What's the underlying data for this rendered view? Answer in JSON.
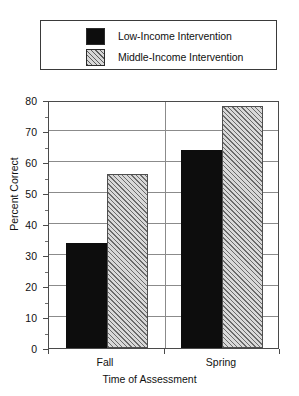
{
  "chart_data": {
    "type": "bar",
    "title": "",
    "xlabel": "Time of Assessment",
    "ylabel": "Percent Correct",
    "categories": [
      "Fall",
      "Spring"
    ],
    "series": [
      {
        "name": "Low-Income Intervention",
        "values": [
          34,
          64
        ],
        "fill": "solid",
        "color": "#0d0d0d"
      },
      {
        "name": "Middle-Income Intervention",
        "values": [
          56,
          78
        ],
        "fill": "hatch",
        "color": "#d8d8d8"
      }
    ],
    "ylim": [
      0,
      80
    ],
    "yticks": [
      0,
      10,
      20,
      30,
      40,
      50,
      60,
      70,
      80
    ],
    "ytick_labels": [
      "0",
      "10",
      "20",
      "30",
      "40",
      "50",
      "60",
      "70",
      "80"
    ],
    "grid": true,
    "grid_axis": "y",
    "legend_position": "above-plot",
    "legend_entries": [
      {
        "label": "Low-Income Intervention",
        "swatch": "solid-black-swatch"
      },
      {
        "label": "Middle-Income Intervention",
        "swatch": "hatched-gray-swatch"
      }
    ]
  }
}
